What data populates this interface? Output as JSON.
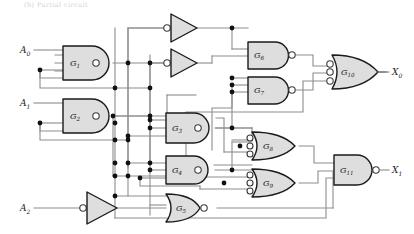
{
  "figure": {
    "kind": "logic-circuit-schematic",
    "top_note": "(b) Partial circuit",
    "background_color": "#ffffff",
    "wire_color": "#8d8d8d",
    "gate_fill": "#dedede",
    "gate_stroke": "#1a1a1a",
    "junction_color": "#111111"
  },
  "inputs": [
    {
      "id": "A0",
      "label": "A",
      "sub": "0",
      "x": 22,
      "y": 50
    },
    {
      "id": "A1",
      "label": "A",
      "sub": "1",
      "x": 22,
      "y": 103
    },
    {
      "id": "A2",
      "label": "A",
      "sub": "2",
      "x": 22,
      "y": 208
    }
  ],
  "outputs": [
    {
      "id": "X0",
      "label": "X",
      "sub": "0",
      "x": 389,
      "y": 48
    },
    {
      "id": "X1",
      "label": "X",
      "sub": "1",
      "x": 389,
      "y": 155
    }
  ],
  "inverters": [
    {
      "id": "INV-A2",
      "name": "inverter-a2",
      "bubble": "input",
      "x": 88,
      "y": 208
    },
    {
      "id": "INV-T1",
      "name": "inverter-top1",
      "bubble": "input",
      "x": 172,
      "y": 27
    },
    {
      "id": "INV-T2",
      "name": "inverter-top2",
      "bubble": "input",
      "x": 172,
      "y": 63
    }
  ],
  "gates": [
    {
      "id": "G1",
      "label": "G",
      "sub": "1",
      "type": "nand",
      "inputs": 3,
      "x": 63,
      "y": 63,
      "w": 44,
      "h": 34
    },
    {
      "id": "G2",
      "label": "G",
      "sub": "2",
      "type": "nand",
      "inputs": 3,
      "x": 63,
      "y": 116,
      "w": 44,
      "h": 34
    },
    {
      "id": "G3",
      "label": "G",
      "sub": "3",
      "type": "nand",
      "inputs": 3,
      "x": 166,
      "y": 113,
      "w": 44,
      "h": 30
    },
    {
      "id": "G4",
      "label": "G",
      "sub": "4",
      "type": "nand",
      "inputs": 3,
      "x": 166,
      "y": 158,
      "w": 44,
      "h": 28
    },
    {
      "id": "G5",
      "label": "G",
      "sub": "5",
      "type": "nor",
      "inputs": 3,
      "x": 166,
      "y": 201,
      "w": 44,
      "h": 28
    },
    {
      "id": "G6",
      "label": "G",
      "sub": "6",
      "type": "nand",
      "inputs": 3,
      "x": 248,
      "y": 42,
      "w": 42,
      "h": 27
    },
    {
      "id": "G7",
      "label": "G",
      "sub": "7",
      "type": "nand",
      "inputs": 4,
      "x": 248,
      "y": 77,
      "w": 42,
      "h": 27
    },
    {
      "id": "G8",
      "label": "G",
      "sub": "8",
      "type": "or-inv-in",
      "inputs": 3,
      "x": 252,
      "y": 133,
      "w": 42,
      "h": 27
    },
    {
      "id": "G9",
      "label": "G",
      "sub": "9",
      "type": "or-inv-in",
      "inputs": 3,
      "x": 252,
      "y": 170,
      "w": 42,
      "h": 27
    },
    {
      "id": "G10",
      "label": "G",
      "sub": "10",
      "type": "or-inv-in",
      "inputs": 3,
      "x": 332,
      "y": 57,
      "w": 42,
      "h": 30
    },
    {
      "id": "G11",
      "label": "G",
      "sub": "11",
      "type": "nand",
      "inputs": 3,
      "x": 334,
      "y": 155,
      "w": 42,
      "h": 30
    }
  ],
  "counts": {
    "gate_count": 11,
    "inverter_count": 3,
    "input_count": 3,
    "output_count": 2
  }
}
